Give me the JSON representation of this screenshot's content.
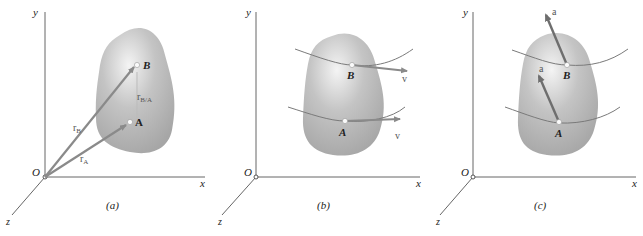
{
  "figure": {
    "type": "rigid body kinematics diagram",
    "panels": [
      {
        "id": "a",
        "caption": "(a)",
        "axes": {
          "x": "x",
          "y": "y",
          "z": "z",
          "origin": "O"
        },
        "points": {
          "A": "A",
          "B": "B"
        },
        "vectors": {
          "rA": "r",
          "rA_sub": "A",
          "rB": "r",
          "rB_sub": "B",
          "rBA": "r",
          "rBA_sub": "B/A"
        }
      },
      {
        "id": "b",
        "caption": "(b)",
        "axes": {
          "x": "x",
          "y": "y",
          "z": "z",
          "origin": "O"
        },
        "points": {
          "A": "A",
          "B": "B"
        },
        "vectors": {
          "vA": "v",
          "vB": "v"
        }
      },
      {
        "id": "c",
        "caption": "(c)",
        "axes": {
          "x": "x",
          "y": "y",
          "z": "z",
          "origin": "O"
        },
        "points": {
          "A": "A",
          "B": "B"
        },
        "vectors": {
          "aA": "a",
          "aB": "a"
        }
      }
    ],
    "colors": {
      "axis": "#555555",
      "body_light": "#f2f2f2",
      "body_dark": "#a8a8a8",
      "vector": "#8a8a8a",
      "vector_dark": "#6e6e6e",
      "path": "#7a7a7a"
    }
  }
}
